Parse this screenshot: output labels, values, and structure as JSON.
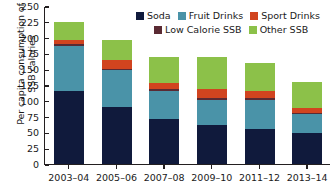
{
  "chart_data": {
    "type": "bar",
    "stacked": true,
    "title": "",
    "xlabel": "",
    "ylabel": "Per capita consumption of SSB calories",
    "ylabel_lines": [
      "Per capita consumption of",
      "SSB calories"
    ],
    "ylim": [
      0,
      250
    ],
    "ytick_step": 25,
    "yticks": [
      250,
      225,
      200,
      175,
      150,
      125,
      100,
      75,
      50,
      25,
      0
    ],
    "ytick_labels": [
      "250",
      "225",
      "200",
      "175",
      "150",
      "125",
      "100",
      "75",
      "50",
      "25",
      "0"
    ],
    "grid": false,
    "legend_position": "top-right",
    "categories": [
      "2003–04",
      "2005–06",
      "2007–08",
      "2009–10",
      "2011–12",
      "2013–14"
    ],
    "series": [
      {
        "name": "Soda",
        "color": "#101a3c",
        "values": [
          116,
          90,
          72,
          61,
          55,
          49
        ]
      },
      {
        "name": "Fruit Drinks",
        "color": "#4a93a8",
        "values": [
          71,
          59,
          44,
          41,
          47,
          30
        ]
      },
      {
        "name": "Low Calorie SSB",
        "color": "#5a2a33",
        "values": [
          3,
          2,
          2,
          2,
          2,
          2
        ]
      },
      {
        "name": "Sport Drinks",
        "color": "#d1441f",
        "values": [
          7,
          14,
          10,
          15,
          11,
          8
        ]
      },
      {
        "name": "Other SSB",
        "color": "#8cc149",
        "values": [
          27,
          31,
          41,
          50,
          45,
          41
        ]
      }
    ],
    "totals": [
      224,
      196,
      169,
      169,
      160,
      130
    ]
  },
  "legend": {
    "row1": [
      {
        "label": "Soda",
        "color": "#101a3c"
      },
      {
        "label": "Fruit Drinks",
        "color": "#4a93a8"
      },
      {
        "label": "Sport Drinks",
        "color": "#d1441f"
      }
    ],
    "row2": [
      {
        "label": "Low Calorie SSB",
        "color": "#5a2a33"
      },
      {
        "label": "Other SSB",
        "color": "#8cc149"
      }
    ]
  },
  "axis": {
    "line_color": "#231f20",
    "text_color": "#1a1a1a"
  }
}
